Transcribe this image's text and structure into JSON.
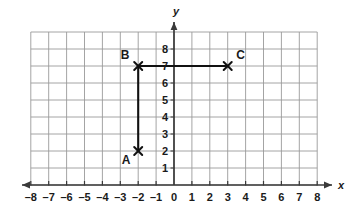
{
  "figure": {
    "title": "",
    "background_color": "#ffffff",
    "grid_color": "#9a9a9a",
    "axis_color": "#3a3a3a",
    "segment_color": "#111111",
    "label_color": "#1a1a1a"
  },
  "axes": {
    "x_axis_label": "x",
    "y_axis_label": "y",
    "x_ticks": [
      "-8",
      "-7",
      "-6",
      "-5",
      "-4",
      "-3",
      "-2",
      "-1",
      "0",
      "1",
      "2",
      "3",
      "4",
      "5",
      "6",
      "7",
      "8"
    ],
    "y_ticks": [
      "1",
      "2",
      "3",
      "4",
      "5",
      "6",
      "7",
      "8"
    ],
    "x_range": [
      -8,
      8
    ],
    "y_range": [
      0,
      9
    ],
    "grid": true,
    "x_arrows": [
      "left",
      "right"
    ],
    "y_arrows": [
      "up"
    ]
  },
  "chart_data": {
    "type": "scatter",
    "title": "",
    "xlabel": "x",
    "ylabel": "y",
    "xlim": [
      -8,
      8
    ],
    "ylim": [
      0,
      9
    ],
    "grid": true,
    "legend": "none",
    "points": [
      {
        "label": "A",
        "x": -2,
        "y": 2,
        "marker": "x",
        "label_position": "below-left"
      },
      {
        "label": "B",
        "x": -2,
        "y": 7,
        "marker": "x",
        "label_position": "above-left"
      },
      {
        "label": "C",
        "x": 3,
        "y": 7,
        "marker": "x",
        "label_position": "above-right"
      }
    ],
    "segments": [
      {
        "name": "AB",
        "from": "A",
        "to": "B"
      },
      {
        "name": "BC",
        "from": "B",
        "to": "C"
      }
    ],
    "x_tick_values": [
      -8,
      -7,
      -6,
      -5,
      -4,
      -3,
      -2,
      -1,
      0,
      1,
      2,
      3,
      4,
      5,
      6,
      7,
      8
    ],
    "y_tick_values": [
      1,
      2,
      3,
      4,
      5,
      6,
      7,
      8
    ]
  }
}
